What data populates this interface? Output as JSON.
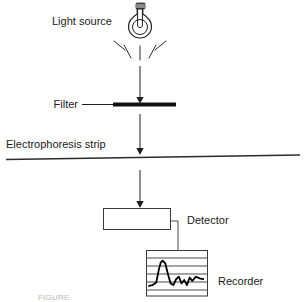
{
  "figure": {
    "width": 304,
    "height": 302,
    "background": "#ffffff",
    "ink_color": "#1f1f1f"
  },
  "labels": {
    "light_source": "Light source",
    "filter": "Filter",
    "electrophoresis_strip": "Electrophoresis strip",
    "detector": "Detector",
    "recorder": "Recorder"
  },
  "caption": {
    "cut_off_text": "FIGURE"
  },
  "components": {
    "bulb": {
      "name": "light-bulb",
      "center_x": 140,
      "center_y": 22,
      "rays": 5
    },
    "filter_bar": {
      "name": "filter-bar",
      "x1": 113,
      "x2": 176,
      "y": 104,
      "thickness": 4
    },
    "strip_line": {
      "name": "electrophoresis-strip-line",
      "x1": 6,
      "x2": 300,
      "y_left": 159,
      "y_right": 155
    },
    "detector_box": {
      "name": "detector-box",
      "x": 103,
      "y": 208,
      "width": 67,
      "height": 21
    },
    "recorder_box": {
      "name": "recorder-box",
      "x": 146,
      "y": 250,
      "width": 62,
      "height": 46,
      "grid_lines": 5
    },
    "arrows": [
      {
        "name": "beam-arrow-source-to-filter",
        "x": 140,
        "y1": 66,
        "y2": 101
      },
      {
        "name": "beam-arrow-filter-to-strip",
        "x": 140,
        "y1": 114,
        "y2": 152
      },
      {
        "name": "beam-arrow-strip-to-detector",
        "x": 140,
        "y1": 170,
        "y2": 205
      }
    ],
    "connector": {
      "name": "detector-to-recorder-connector",
      "from_x": 170,
      "from_y": 221,
      "elbow_x": 178,
      "to_y": 250
    }
  },
  "chart_data": {
    "type": "line",
    "xlabel": "",
    "ylabel": "",
    "grid": true,
    "legend": "none",
    "x": [
      0,
      4,
      8,
      11,
      13,
      15,
      18,
      21,
      24,
      27,
      30,
      33,
      36,
      39,
      42,
      45,
      48,
      52,
      56,
      60
    ],
    "values": [
      6,
      7,
      10,
      26,
      34,
      36,
      33,
      20,
      9,
      7,
      14,
      17,
      9,
      13,
      7,
      16,
      12,
      17,
      15,
      14
    ],
    "ylim": [
      0,
      44
    ],
    "xlim": [
      0,
      62
    ]
  }
}
